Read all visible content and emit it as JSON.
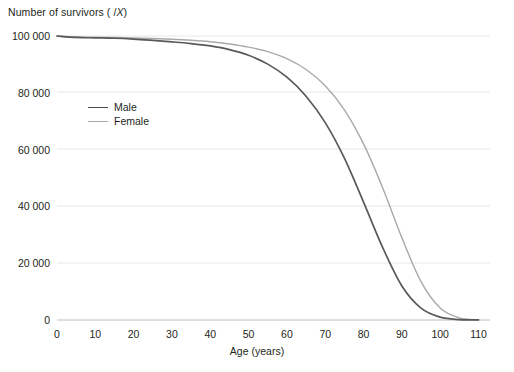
{
  "chart_data": {
    "type": "line",
    "title": "",
    "subtitle": "",
    "xlabel": "Age (years)",
    "ylabel": "Number of survivors ( /X)",
    "ylabel_prefix": "Number of survivors ( /",
    "ylabel_italic": "X",
    "ylabel_suffix": ")",
    "xlim": [
      0,
      113
    ],
    "ylim": [
      0,
      104000
    ],
    "grid": "horizontal",
    "legend_position": "inside-upper-left",
    "xticks": [
      0,
      10,
      20,
      30,
      40,
      50,
      60,
      70,
      80,
      90,
      100,
      110
    ],
    "xtick_labels": [
      "0",
      "10",
      "20",
      "30",
      "40",
      "50",
      "60",
      "70",
      "80",
      "90",
      "100",
      "110"
    ],
    "yticks": [
      0,
      20000,
      40000,
      60000,
      80000,
      100000
    ],
    "ytick_labels": [
      "0",
      "20 000",
      "40 000",
      "60 000",
      "80 000",
      "100 000"
    ],
    "x": [
      0,
      5,
      10,
      15,
      20,
      25,
      30,
      35,
      40,
      45,
      50,
      55,
      60,
      65,
      70,
      75,
      80,
      85,
      90,
      95,
      100,
      105,
      110
    ],
    "series": [
      {
        "name": "Male",
        "color": "#58595b",
        "values": [
          100000,
          99500,
          99350,
          99200,
          98900,
          98450,
          97950,
          97350,
          96500,
          95200,
          93200,
          90100,
          85500,
          78800,
          69500,
          57000,
          41500,
          25500,
          12000,
          4200,
          1000,
          150,
          10
        ]
      },
      {
        "name": "Female",
        "color": "#a7a9ac",
        "values": [
          100000,
          99650,
          99550,
          99450,
          99300,
          99100,
          98850,
          98500,
          98000,
          97200,
          96100,
          94500,
          92000,
          88200,
          82500,
          74000,
          62000,
          46500,
          29000,
          13500,
          4200,
          700,
          60
        ]
      }
    ],
    "annotations": []
  },
  "legend": {
    "items": [
      {
        "label": "Male"
      },
      {
        "label": "Female"
      }
    ]
  }
}
